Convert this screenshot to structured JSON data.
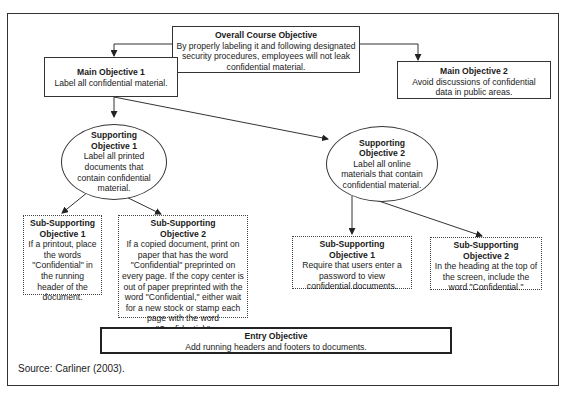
{
  "diagram": {
    "overall": {
      "title": "Overall Course Objective",
      "body": "By properly labeling it and following designated security procedures, employees will not leak confidential material."
    },
    "main_objectives": [
      {
        "title": "Main Objective 1",
        "body": "Label all confidential material."
      },
      {
        "title": "Main Objective 2",
        "body": "Avoid discussions of confidential data in public areas."
      }
    ],
    "supporting_objectives": [
      {
        "title_line1": "Supporting",
        "title_line2": "Objective 1",
        "body": "Label all printed documents that contain confidential material."
      },
      {
        "title_line1": "Supporting",
        "title_line2": "Objective 2",
        "body": "Label all online materials that contain confidential material."
      }
    ],
    "sub_supporting_objectives": [
      {
        "parent": "Supporting Objective 1",
        "title_line1": "Sub-Supporting",
        "title_line2": "Objective 1",
        "body": "If a printout, place the words \"Confidential\" in the running header of the document."
      },
      {
        "parent": "Supporting Objective 1",
        "title_line1": "Sub-Supporting",
        "title_line2": "Objective 2",
        "body": "If a copied document, print on paper that has the word \"Confidential\" preprinted on every page. If the copy center is out of paper preprinted with the word \"Confidential,\" either wait for a new stock or stamp each page with the word \"Confidential.\""
      },
      {
        "parent": "Supporting Objective 2",
        "title_line1": "Sub-Supporting",
        "title_line2": "Objective 1",
        "body": "Require that users enter a password to view confidential documents."
      },
      {
        "parent": "Supporting Objective 2",
        "title_line1": "Sub-Supporting",
        "title_line2": "Objective 2",
        "body": "In the heading at the top of the screen, include the word \"Confidential.\""
      }
    ],
    "entry": {
      "title": "Entry Objective",
      "body": "Add running headers and footers to documents."
    },
    "source": "Source: Carliner (2003)."
  }
}
